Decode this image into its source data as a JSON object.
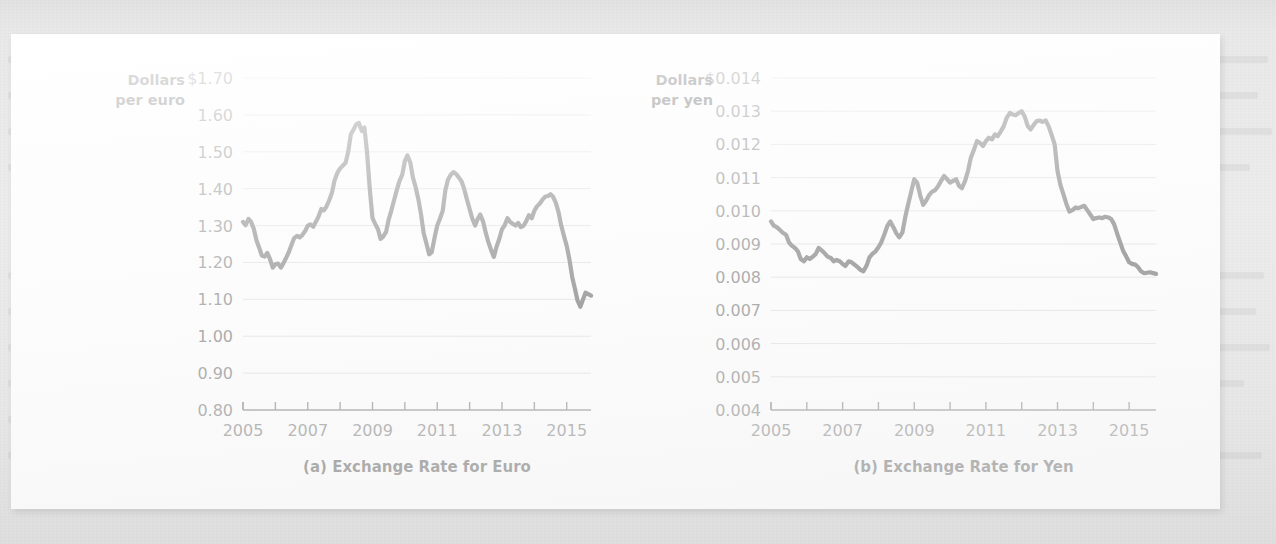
{
  "figure": {
    "panel_bg": "#fdfdfd",
    "page_bg": "#e9e9e9",
    "series_color": "#3c3c3c",
    "gridline_color": "#cfcfcf",
    "axis_color": "#4f4f4f"
  },
  "chart_data": [
    {
      "id": "euro",
      "type": "line",
      "title": "(a) Exchange Rate for Euro",
      "ylabel_line1": "Dollars",
      "ylabel_line2": "per euro",
      "xlabel": "",
      "ylim": [
        0.8,
        1.7
      ],
      "xlim": [
        2005.0,
        2015.75
      ],
      "grid": true,
      "legend": "none",
      "ytick_labels": [
        "$1.70",
        "1.60",
        "1.50",
        "1.40",
        "1.30",
        "1.20",
        "1.10",
        "1.00",
        "0.90",
        "0.80"
      ],
      "ytick_values": [
        1.7,
        1.6,
        1.5,
        1.4,
        1.3,
        1.2,
        1.1,
        1.0,
        0.9,
        0.8
      ],
      "xtick_values": [
        2005,
        2006,
        2007,
        2008,
        2009,
        2010,
        2011,
        2012,
        2013,
        2014,
        2015
      ],
      "xtick_labels": [
        "2005",
        "",
        "2007",
        "",
        "2009",
        "",
        "2011",
        "",
        "2013",
        "",
        "2015"
      ],
      "series": [
        {
          "name": "Dollars per euro",
          "x": [
            2005.0,
            2005.08,
            2005.17,
            2005.25,
            2005.33,
            2005.42,
            2005.5,
            2005.58,
            2005.67,
            2005.75,
            2005.83,
            2005.92,
            2006.0,
            2006.08,
            2006.17,
            2006.25,
            2006.33,
            2006.42,
            2006.5,
            2006.58,
            2006.67,
            2006.75,
            2006.83,
            2006.92,
            2007.0,
            2007.08,
            2007.17,
            2007.25,
            2007.33,
            2007.42,
            2007.5,
            2007.58,
            2007.67,
            2007.75,
            2007.83,
            2007.92,
            2008.0,
            2008.08,
            2008.17,
            2008.25,
            2008.33,
            2008.42,
            2008.5,
            2008.58,
            2008.67,
            2008.75,
            2008.83,
            2008.92,
            2009.0,
            2009.08,
            2009.17,
            2009.25,
            2009.33,
            2009.42,
            2009.5,
            2009.58,
            2009.67,
            2009.75,
            2009.83,
            2009.92,
            2010.0,
            2010.08,
            2010.17,
            2010.25,
            2010.33,
            2010.42,
            2010.5,
            2010.58,
            2010.67,
            2010.75,
            2010.83,
            2010.92,
            2011.0,
            2011.08,
            2011.17,
            2011.25,
            2011.33,
            2011.42,
            2011.5,
            2011.58,
            2011.67,
            2011.75,
            2011.83,
            2011.92,
            2012.0,
            2012.08,
            2012.17,
            2012.25,
            2012.33,
            2012.42,
            2012.5,
            2012.58,
            2012.67,
            2012.75,
            2012.83,
            2012.92,
            2013.0,
            2013.08,
            2013.17,
            2013.25,
            2013.33,
            2013.42,
            2013.5,
            2013.58,
            2013.67,
            2013.75,
            2013.83,
            2013.92,
            2014.0,
            2014.08,
            2014.17,
            2014.25,
            2014.33,
            2014.42,
            2014.5,
            2014.58,
            2014.67,
            2014.75,
            2014.83,
            2014.92,
            2015.0,
            2015.08,
            2015.17,
            2015.25,
            2015.33,
            2015.42,
            2015.58,
            2015.75
          ],
          "y": [
            1.31,
            1.301,
            1.318,
            1.31,
            1.292,
            1.259,
            1.24,
            1.219,
            1.216,
            1.226,
            1.21,
            1.186,
            1.195,
            1.197,
            1.186,
            1.198,
            1.212,
            1.229,
            1.248,
            1.266,
            1.272,
            1.268,
            1.274,
            1.285,
            1.3,
            1.303,
            1.297,
            1.31,
            1.324,
            1.345,
            1.341,
            1.352,
            1.37,
            1.39,
            1.423,
            1.444,
            1.455,
            1.462,
            1.47,
            1.5,
            1.547,
            1.561,
            1.575,
            1.578,
            1.556,
            1.566,
            1.5,
            1.395,
            1.32,
            1.305,
            1.29,
            1.264,
            1.27,
            1.283,
            1.316,
            1.34,
            1.37,
            1.396,
            1.42,
            1.438,
            1.475,
            1.49,
            1.47,
            1.43,
            1.405,
            1.37,
            1.33,
            1.28,
            1.25,
            1.222,
            1.228,
            1.268,
            1.3,
            1.318,
            1.34,
            1.395,
            1.424,
            1.438,
            1.445,
            1.44,
            1.43,
            1.42,
            1.4,
            1.37,
            1.345,
            1.32,
            1.3,
            1.318,
            1.33,
            1.31,
            1.28,
            1.255,
            1.232,
            1.215,
            1.242,
            1.265,
            1.29,
            1.3,
            1.32,
            1.31,
            1.305,
            1.3,
            1.307,
            1.296,
            1.3,
            1.312,
            1.328,
            1.32,
            1.34,
            1.352,
            1.36,
            1.37,
            1.378,
            1.38,
            1.385,
            1.378,
            1.36,
            1.335,
            1.3,
            1.27,
            1.245,
            1.21,
            1.16,
            1.13,
            1.098,
            1.08,
            1.118,
            1.11
          ]
        }
      ]
    },
    {
      "id": "yen",
      "type": "line",
      "title": "(b) Exchange Rate for Yen",
      "ylabel_line1": "Dollars",
      "ylabel_line2": "per yen",
      "xlabel": "",
      "ylim": [
        0.004,
        0.014
      ],
      "xlim": [
        2005.0,
        2015.75
      ],
      "grid": true,
      "legend": "none",
      "ytick_labels": [
        "$0.014",
        "0.013",
        "0.012",
        "0.011",
        "0.010",
        "0.009",
        "0.008",
        "0.007",
        "0.006",
        "0.005",
        "0.004"
      ],
      "ytick_values": [
        0.014,
        0.013,
        0.012,
        0.011,
        0.01,
        0.009,
        0.008,
        0.007,
        0.006,
        0.005,
        0.004
      ],
      "xtick_values": [
        2005,
        2006,
        2007,
        2008,
        2009,
        2010,
        2011,
        2012,
        2013,
        2014,
        2015
      ],
      "xtick_labels": [
        "2005",
        "",
        "2007",
        "",
        "2009",
        "",
        "2011",
        "",
        "2013",
        "",
        "2015"
      ],
      "series": [
        {
          "name": "Dollars per yen",
          "x": [
            2005.0,
            2005.08,
            2005.17,
            2005.25,
            2005.33,
            2005.42,
            2005.5,
            2005.58,
            2005.67,
            2005.75,
            2005.83,
            2005.92,
            2006.0,
            2006.08,
            2006.17,
            2006.25,
            2006.33,
            2006.42,
            2006.5,
            2006.58,
            2006.67,
            2006.75,
            2006.83,
            2006.92,
            2007.0,
            2007.08,
            2007.17,
            2007.25,
            2007.33,
            2007.42,
            2007.5,
            2007.58,
            2007.67,
            2007.75,
            2007.83,
            2007.92,
            2008.0,
            2008.08,
            2008.17,
            2008.25,
            2008.33,
            2008.42,
            2008.5,
            2008.58,
            2008.67,
            2008.75,
            2008.83,
            2008.92,
            2009.0,
            2009.08,
            2009.17,
            2009.25,
            2009.33,
            2009.42,
            2009.5,
            2009.58,
            2009.67,
            2009.75,
            2009.83,
            2009.92,
            2010.0,
            2010.08,
            2010.17,
            2010.25,
            2010.33,
            2010.42,
            2010.5,
            2010.58,
            2010.67,
            2010.75,
            2010.83,
            2010.92,
            2011.0,
            2011.08,
            2011.17,
            2011.25,
            2011.33,
            2011.42,
            2011.5,
            2011.58,
            2011.67,
            2011.75,
            2011.83,
            2011.92,
            2012.0,
            2012.08,
            2012.17,
            2012.25,
            2012.33,
            2012.42,
            2012.5,
            2012.58,
            2012.67,
            2012.75,
            2012.83,
            2012.92,
            2013.0,
            2013.08,
            2013.17,
            2013.25,
            2013.33,
            2013.42,
            2013.5,
            2013.58,
            2013.67,
            2013.75,
            2013.83,
            2013.92,
            2014.0,
            2014.08,
            2014.17,
            2014.25,
            2014.33,
            2014.42,
            2014.5,
            2014.58,
            2014.67,
            2014.75,
            2014.83,
            2014.92,
            2015.0,
            2015.08,
            2015.17,
            2015.25,
            2015.33,
            2015.42,
            2015.58,
            2015.75
          ],
          "y": [
            0.00968,
            0.00955,
            0.0095,
            0.00942,
            0.00934,
            0.00928,
            0.00905,
            0.00895,
            0.00888,
            0.00878,
            0.00855,
            0.00848,
            0.0086,
            0.00855,
            0.00862,
            0.0087,
            0.00888,
            0.0088,
            0.00872,
            0.00862,
            0.00858,
            0.00848,
            0.00852,
            0.00848,
            0.0084,
            0.00834,
            0.00848,
            0.00845,
            0.00838,
            0.0083,
            0.00822,
            0.00818,
            0.00835,
            0.0086,
            0.0087,
            0.00878,
            0.0089,
            0.00905,
            0.0093,
            0.00955,
            0.00968,
            0.0095,
            0.00932,
            0.0092,
            0.00935,
            0.00982,
            0.0102,
            0.0106,
            0.01095,
            0.01085,
            0.01045,
            0.01018,
            0.0103,
            0.01048,
            0.01058,
            0.01062,
            0.01075,
            0.0109,
            0.01105,
            0.01095,
            0.01085,
            0.0109,
            0.01095,
            0.01075,
            0.01068,
            0.0109,
            0.0112,
            0.0116,
            0.01185,
            0.0121,
            0.01205,
            0.01195,
            0.0121,
            0.0122,
            0.01215,
            0.0123,
            0.01225,
            0.0124,
            0.01255,
            0.0128,
            0.01295,
            0.0129,
            0.01288,
            0.01295,
            0.013,
            0.01285,
            0.01255,
            0.01245,
            0.01258,
            0.0127,
            0.01272,
            0.01268,
            0.01272,
            0.01255,
            0.0123,
            0.012,
            0.0112,
            0.01078,
            0.01048,
            0.0102,
            0.00998,
            0.01002,
            0.0101,
            0.01008,
            0.01012,
            0.01015,
            0.01002,
            0.00988,
            0.00975,
            0.00978,
            0.0098,
            0.00978,
            0.00982,
            0.0098,
            0.00975,
            0.0096,
            0.0093,
            0.00905,
            0.0088,
            0.00862,
            0.00845,
            0.0084,
            0.00838,
            0.0083,
            0.00818,
            0.00812,
            0.00815,
            0.0081
          ]
        }
      ]
    }
  ]
}
